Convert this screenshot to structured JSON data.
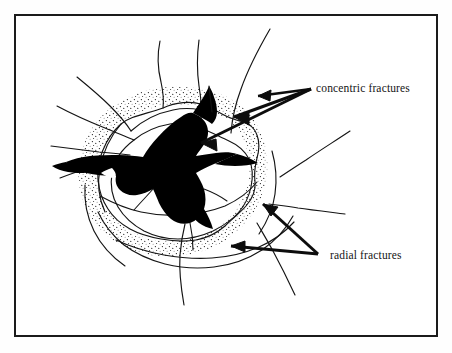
{
  "figure": {
    "type": "geological-line-diagram",
    "background_color": "#ffffff",
    "frame": {
      "border_color": "#1b1b1b",
      "border_width_px": 2,
      "x": 14,
      "y": 14,
      "width": 424,
      "height": 323
    },
    "ink_color": "#141414",
    "crater_fill_color": "#000000",
    "stipple_color": "#1a1a1a"
  },
  "annotations": [
    {
      "id": "concentric",
      "label": "concentric fractures",
      "label_x": 316,
      "label_y": 82,
      "arrow_origin": {
        "x": 311,
        "y": 89
      },
      "arrow_count": 3,
      "arrow_targets": [
        {
          "x": 252,
          "y": 96
        },
        {
          "x": 228,
          "y": 117
        },
        {
          "x": 196,
          "y": 142
        }
      ]
    },
    {
      "id": "radial",
      "label": "radial fractures",
      "label_x": 330,
      "label_y": 249,
      "arrow_origin": {
        "x": 318,
        "y": 254
      },
      "arrow_count": 2,
      "arrow_targets": [
        {
          "x": 258,
          "y": 203
        },
        {
          "x": 228,
          "y": 245
        }
      ]
    }
  ],
  "caption_sliver": ""
}
